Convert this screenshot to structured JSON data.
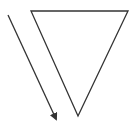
{
  "diagram": {
    "shapes": [
      {
        "type": "inverted-triangle",
        "stroke": "#333333",
        "fill": "#ffffff"
      },
      {
        "type": "arrow",
        "direction": "down-right",
        "stroke": "#333333"
      }
    ]
  }
}
